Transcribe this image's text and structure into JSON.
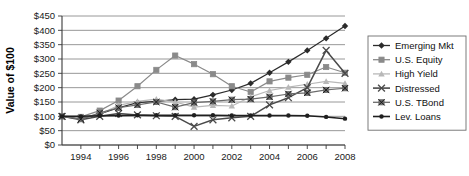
{
  "chart_data": {
    "type": "line",
    "title": "",
    "xlabel": "",
    "ylabel": "Value of $100",
    "ylim": [
      0,
      450
    ],
    "ytick_labels": [
      "$0",
      "$50",
      "$100",
      "$150",
      "$200",
      "$250",
      "$300",
      "$350",
      "$400",
      "$450"
    ],
    "ytick_values": [
      0,
      50,
      100,
      150,
      200,
      250,
      300,
      350,
      400,
      450
    ],
    "xlim": [
      1993,
      2008
    ],
    "x": [
      1993,
      1994,
      1995,
      1996,
      1997,
      1998,
      1999,
      2000,
      2001,
      2002,
      2003,
      2004,
      2005,
      2006,
      2007,
      2008
    ],
    "xtick_values": [
      1994,
      1995,
      1996,
      1997,
      1998,
      1999,
      2000,
      2001,
      2002,
      2003,
      2004,
      2005,
      2006,
      2007,
      2008
    ],
    "xtick_labels": [
      "1994",
      "",
      "1996",
      "",
      "1998",
      "",
      "2000",
      "",
      "2002",
      "",
      "2004",
      "",
      "2006",
      "",
      "2008"
    ],
    "grid": true,
    "legend_position": "right",
    "series": [
      {
        "name": "Emerging Mkt",
        "color": "#2b2b2b",
        "marker": "diamond",
        "values": [
          100,
          92,
          108,
          130,
          148,
          152,
          158,
          160,
          175,
          192,
          215,
          252,
          290,
          330,
          372,
          415
        ]
      },
      {
        "name": "U.S. Equity",
        "color": "#8a8a8a",
        "marker": "square",
        "values": [
          100,
          98,
          120,
          155,
          205,
          262,
          312,
          282,
          247,
          205,
          185,
          222,
          235,
          245,
          272,
          252
        ]
      },
      {
        "name": "High Yield",
        "color": "#b8b8b8",
        "marker": "triangle",
        "values": [
          100,
          96,
          108,
          138,
          152,
          160,
          150,
          132,
          138,
          136,
          168,
          190,
          202,
          212,
          222,
          215
        ]
      },
      {
        "name": "Distressed",
        "color": "#4a4a4a",
        "marker": "cross",
        "values": [
          100,
          88,
          100,
          110,
          105,
          102,
          100,
          65,
          88,
          95,
          100,
          140,
          165,
          200,
          330,
          250
        ]
      },
      {
        "name": "U.S. TBond",
        "color": "#6b6b6b",
        "marker": "square-x",
        "values": [
          100,
          90,
          112,
          130,
          140,
          150,
          132,
          148,
          152,
          158,
          160,
          168,
          178,
          182,
          192,
          198
        ]
      },
      {
        "name": "Lev. Loans",
        "color": "#1f1f1f",
        "marker": "dot",
        "values": [
          100,
          100,
          102,
          103,
          104,
          104,
          104,
          104,
          104,
          103,
          103,
          103,
          103,
          102,
          98,
          92
        ]
      }
    ]
  },
  "legend": {
    "items": [
      {
        "label": "Emerging Mkt"
      },
      {
        "label": "U.S. Equity"
      },
      {
        "label": "High Yield"
      },
      {
        "label": "Distressed"
      },
      {
        "label": "U.S. TBond"
      },
      {
        "label": "Lev. Loans"
      }
    ]
  }
}
